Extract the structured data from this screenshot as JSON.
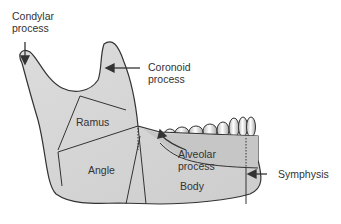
{
  "diagram": {
    "colors": {
      "bone_fill": "#d2d2d2",
      "bone_light": "#e4e4e4",
      "outline": "#333333",
      "label": "#333333"
    },
    "labels": {
      "condylar": [
        "Condylar",
        "process"
      ],
      "coronoid": [
        "Coronoid",
        "process"
      ],
      "ramus": "Ramus",
      "angle": "Angle",
      "alveolar": [
        "Alveolar",
        "process"
      ],
      "body": "Body",
      "symphysis": "Symphysis"
    }
  }
}
